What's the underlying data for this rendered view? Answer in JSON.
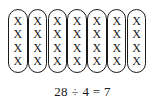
{
  "diagram": {
    "groups": [
      {
        "marks": [
          "X",
          "X",
          "X",
          "X"
        ]
      },
      {
        "marks": [
          "X",
          "X",
          "X",
          "X"
        ]
      },
      {
        "marks": [
          "X",
          "X",
          "X",
          "X"
        ]
      },
      {
        "marks": [
          "X",
          "X",
          "X",
          "X"
        ]
      },
      {
        "marks": [
          "X",
          "X",
          "X",
          "X"
        ]
      },
      {
        "marks": [
          "X",
          "X",
          "X",
          "X"
        ]
      },
      {
        "marks": [
          "X",
          "X",
          "X",
          "X"
        ]
      }
    ],
    "group_count": 7,
    "marks_per_group": 4,
    "total_marks": 28,
    "equation": "28 ÷ 4 = 7"
  }
}
